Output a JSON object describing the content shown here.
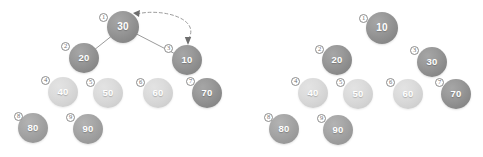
{
  "figure": {
    "background_color": "#ffffff",
    "panels": [
      {
        "name": "before-swap",
        "label": "left-diagram",
        "has_edges": true,
        "nodes": [
          {
            "index": "1",
            "index_glyph": "①",
            "value": "30",
            "tone": "dark",
            "x": 123,
            "y": 27,
            "r": 16,
            "badge_x": 99,
            "badge_y": 13
          },
          {
            "index": "2",
            "index_glyph": "②",
            "value": "20",
            "tone": "dark",
            "x": 84,
            "y": 58,
            "r": 15,
            "badge_x": 61,
            "badge_y": 42
          },
          {
            "index": "3",
            "index_glyph": "③",
            "value": "10",
            "tone": "dark",
            "x": 187,
            "y": 60,
            "r": 15,
            "badge_x": 164,
            "badge_y": 44
          },
          {
            "index": "4",
            "index_glyph": "④",
            "value": "40",
            "tone": "light",
            "x": 63,
            "y": 92,
            "r": 15,
            "badge_x": 41,
            "badge_y": 76
          },
          {
            "index": "5",
            "index_glyph": "⑤",
            "value": "50",
            "tone": "light",
            "x": 108,
            "y": 93,
            "r": 15,
            "badge_x": 86,
            "badge_y": 78
          },
          {
            "index": "6",
            "index_glyph": "⑥",
            "value": "60",
            "tone": "light",
            "x": 158,
            "y": 93,
            "r": 15,
            "badge_x": 136,
            "badge_y": 78
          },
          {
            "index": "7",
            "index_glyph": "⑦",
            "value": "70",
            "tone": "dark",
            "x": 207,
            "y": 93,
            "r": 15,
            "badge_x": 186,
            "badge_y": 77
          },
          {
            "index": "8",
            "index_glyph": "⑧",
            "value": "80",
            "tone": "mid",
            "x": 33,
            "y": 128,
            "r": 15,
            "badge_x": 14,
            "badge_y": 112
          },
          {
            "index": "9",
            "index_glyph": "⑨",
            "value": "90",
            "tone": "mid",
            "x": 88,
            "y": 129,
            "r": 15,
            "badge_x": 66,
            "badge_y": 113
          }
        ],
        "edges": [
          {
            "from": "1",
            "to": "2"
          },
          {
            "from": "1",
            "to": "3"
          }
        ],
        "swap_arrow": {
          "style": "dashed-curved-double-headed",
          "from_node": "1",
          "to_node": "3",
          "meaning": "swap"
        }
      },
      {
        "name": "after-swap",
        "label": "right-diagram",
        "has_edges": false,
        "nodes": [
          {
            "index": "1",
            "index_glyph": "①",
            "value": "10",
            "tone": "dark",
            "x": 382,
            "y": 28,
            "r": 16,
            "badge_x": 359,
            "badge_y": 14
          },
          {
            "index": "2",
            "index_glyph": "②",
            "value": "20",
            "tone": "dark",
            "x": 337,
            "y": 60,
            "r": 15,
            "badge_x": 315,
            "badge_y": 45
          },
          {
            "index": "3",
            "index_glyph": "③",
            "value": "30",
            "tone": "dark",
            "x": 432,
            "y": 62,
            "r": 15,
            "badge_x": 410,
            "badge_y": 46
          },
          {
            "index": "4",
            "index_glyph": "④",
            "value": "40",
            "tone": "light",
            "x": 313,
            "y": 93,
            "r": 15,
            "badge_x": 291,
            "badge_y": 77
          },
          {
            "index": "5",
            "index_glyph": "⑤",
            "value": "50",
            "tone": "light",
            "x": 358,
            "y": 94,
            "r": 15,
            "badge_x": 336,
            "badge_y": 78
          },
          {
            "index": "6",
            "index_glyph": "⑥",
            "value": "60",
            "tone": "light",
            "x": 408,
            "y": 94,
            "r": 15,
            "badge_x": 386,
            "badge_y": 78
          },
          {
            "index": "7",
            "index_glyph": "⑦",
            "value": "70",
            "tone": "dark",
            "x": 456,
            "y": 94,
            "r": 15,
            "badge_x": 435,
            "badge_y": 78
          },
          {
            "index": "8",
            "index_glyph": "⑧",
            "value": "80",
            "tone": "mid",
            "x": 284,
            "y": 129,
            "r": 15,
            "badge_x": 264,
            "badge_y": 113
          },
          {
            "index": "9",
            "index_glyph": "⑨",
            "value": "90",
            "tone": "mid",
            "x": 338,
            "y": 130,
            "r": 15,
            "badge_x": 317,
            "badge_y": 114
          }
        ],
        "edges": [],
        "swap_arrow": null
      }
    ],
    "colors": {
      "node_dark": "#8d8d8d",
      "node_mid": "#9d9d9d",
      "node_light": "#d3d3d3",
      "edge": "#9b9b9b",
      "arrow": "#6e6e6e",
      "badge_border": "#8c8c8c",
      "badge_text": "#6f6f6f",
      "node_text": "#ffffff"
    }
  }
}
